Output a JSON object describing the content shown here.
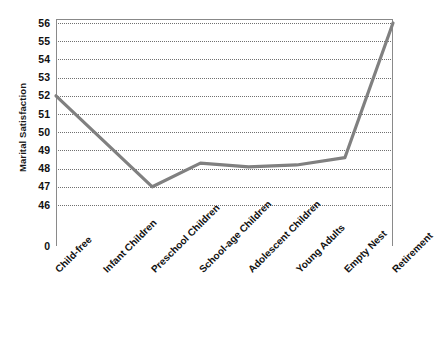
{
  "chart_data": {
    "type": "line",
    "title": "",
    "xlabel": "",
    "ylabel": "Marital Satisfaction",
    "categories": [
      "Child-free",
      "Infant Children",
      "Preschool Children",
      "School-age Children",
      "Adolescent Children",
      "Young Adults",
      "Empty Nest",
      "Retirement"
    ],
    "values": [
      52.0,
      49.5,
      47.0,
      48.3,
      48.1,
      48.2,
      48.6,
      56.0
    ],
    "series": [
      {
        "name": "Marital Satisfaction",
        "values": [
          52.0,
          49.5,
          47.0,
          48.3,
          48.1,
          48.2,
          48.6,
          56.0
        ]
      }
    ],
    "ylim": [
      46,
      56
    ],
    "y_ticks": [
      56,
      55,
      54,
      53,
      52,
      51,
      50,
      49,
      48,
      47,
      46,
      0
    ],
    "y_tick_labels": [
      "56",
      "55",
      "54",
      "53",
      "52",
      "51",
      "50",
      "49",
      "48",
      "47",
      "46",
      "0"
    ],
    "axis_break_below": 46,
    "grid": true,
    "grid_style": "dotted",
    "legend": false,
    "legend_position": "none",
    "line_color": "#808080",
    "grid_color": "#707070",
    "axis_color": "#8a8a8a",
    "background_color": "#ffffff"
  },
  "axis": {
    "y_title": "Marital Satisfaction"
  },
  "caption": {
    "text": ""
  }
}
